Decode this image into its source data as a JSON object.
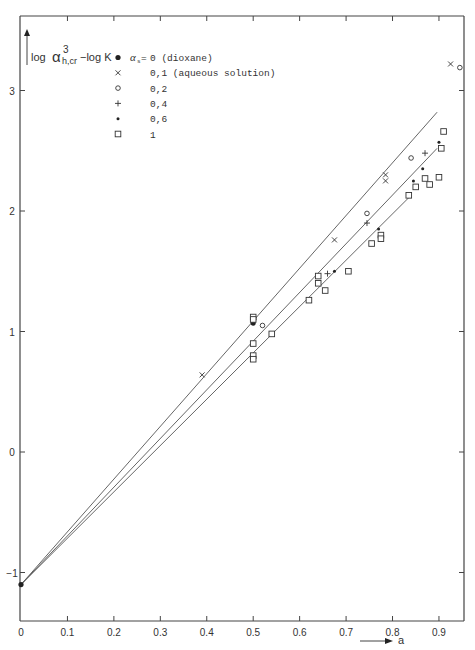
{
  "chart_data": {
    "type": "scatter",
    "title": "",
    "xlabel": "a",
    "ylabel": "log α³_h,cr − log K",
    "xlim": [
      0,
      0.95
    ],
    "ylim": [
      -1.4,
      3.6
    ],
    "x_ticks": [
      "0",
      "0.1",
      "0.2",
      "0.3",
      "0.4",
      "0.5",
      "0.6",
      "0.7",
      "0.8",
      "0.9"
    ],
    "y_ticks": [
      "-1",
      "0",
      "1",
      "2",
      "3"
    ],
    "grid": false,
    "legend_position": "upper-left (inside)",
    "legend_title": "α_s =",
    "series": [
      {
        "name": "0 (dioxane)",
        "marker": "filled-circle-large",
        "points": [
          [
            0.0,
            -1.1
          ],
          [
            0.5,
            1.07
          ]
        ]
      },
      {
        "name": "0.1 (aqueous solution)",
        "marker": "x",
        "points": [
          [
            0.39,
            0.64
          ],
          [
            0.675,
            1.76
          ],
          [
            0.785,
            2.3
          ],
          [
            0.785,
            2.25
          ],
          [
            0.925,
            3.22
          ]
        ]
      },
      {
        "name": "0.2",
        "marker": "open-circle",
        "points": [
          [
            0.52,
            1.05
          ],
          [
            0.745,
            1.98
          ],
          [
            0.84,
            2.44
          ],
          [
            0.945,
            3.19
          ]
        ]
      },
      {
        "name": "0.4",
        "marker": "plus",
        "points": [
          [
            0.5,
            1.1
          ],
          [
            0.66,
            1.48
          ],
          [
            0.745,
            1.9
          ],
          [
            0.87,
            2.48
          ]
        ]
      },
      {
        "name": "0.6",
        "marker": "small-dot",
        "points": [
          [
            0.675,
            1.5
          ],
          [
            0.77,
            1.85
          ],
          [
            0.845,
            2.25
          ],
          [
            0.865,
            2.35
          ],
          [
            0.9,
            2.57
          ]
        ]
      },
      {
        "name": "1",
        "marker": "open-square",
        "points": [
          [
            0.5,
            1.12
          ],
          [
            0.5,
            1.1
          ],
          [
            0.5,
            0.9
          ],
          [
            0.5,
            0.8
          ],
          [
            0.5,
            0.77
          ],
          [
            0.54,
            0.98
          ],
          [
            0.62,
            1.26
          ],
          [
            0.64,
            1.4
          ],
          [
            0.64,
            1.46
          ],
          [
            0.655,
            1.34
          ],
          [
            0.705,
            1.5
          ],
          [
            0.755,
            1.73
          ],
          [
            0.775,
            1.8
          ],
          [
            0.775,
            1.77
          ],
          [
            0.835,
            2.13
          ],
          [
            0.85,
            2.2
          ],
          [
            0.87,
            2.27
          ],
          [
            0.88,
            2.22
          ],
          [
            0.9,
            2.28
          ],
          [
            0.905,
            2.52
          ],
          [
            0.91,
            2.66
          ]
        ]
      }
    ],
    "fit_lines": [
      {
        "name": "upper",
        "from": [
          0.0,
          -1.1
        ],
        "to": [
          0.896,
          2.82
        ]
      },
      {
        "name": "middle",
        "from": [
          0.0,
          -1.1
        ],
        "to": [
          0.896,
          2.52
        ]
      },
      {
        "name": "lower",
        "from": [
          0.0,
          -1.1
        ],
        "to": [
          0.84,
          2.13
        ]
      }
    ]
  },
  "legend": {
    "prefix": "α",
    "prefix_sub": "s",
    "eq": "= ",
    "items": [
      {
        "label": "0 (dioxane)"
      },
      {
        "label": "0,1 (aqueous solution)"
      },
      {
        "label": "0,2"
      },
      {
        "label": "0,4"
      },
      {
        "label": "0,6"
      },
      {
        "label": "1"
      }
    ]
  },
  "axes": {
    "y_label_log1": "log",
    "y_label_alpha": "α",
    "y_label_sup": "3",
    "y_label_sub": "h,cr",
    "y_label_rest": "−log K",
    "x_label": "a",
    "x_tick_labels": [
      "0",
      "0.1",
      "0.2",
      "0.3",
      "0.4",
      "0.5",
      "0.6",
      "0.7",
      "0.8",
      "0.9"
    ],
    "y_tick_labels": [
      "3",
      "2",
      "1",
      "0",
      "-1"
    ]
  }
}
